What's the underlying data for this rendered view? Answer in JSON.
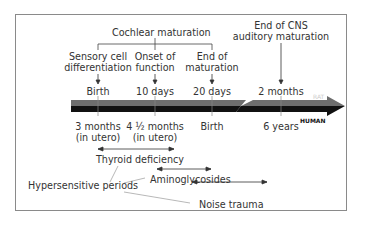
{
  "diagram": {
    "cochlear_header": "Cochlear maturation",
    "milestones": [
      {
        "label_line1": "Sensory cell",
        "label_line2": "differentiation",
        "rat": "Birth",
        "human_line1": "3 months",
        "human_line2": "(in utero)"
      },
      {
        "label_line1": "Onset of",
        "label_line2": "function",
        "rat": "10 days",
        "human_line1": "4 ½ months",
        "human_line2": "(in utero)"
      },
      {
        "label_line1": "End of",
        "label_line2": "maturation",
        "rat": "20 days",
        "human_line1": "Birth",
        "human_line2": ""
      },
      {
        "label_line1": "End of CNS",
        "label_line2": "auditory maturation",
        "rat": "2 months",
        "human_line1": "6 years",
        "human_line2": ""
      }
    ],
    "species": {
      "rat": "RAT",
      "human": "HUMAN"
    },
    "hypersensitive_label": "Hypersensitive periods",
    "periods": [
      {
        "label": "Thyroid deficiency"
      },
      {
        "label": "Aminoglycosides"
      },
      {
        "label": "Noise trauma"
      }
    ],
    "colors": {
      "rat_bar": "#6e6e6e",
      "human_bar": "#111111",
      "border": "#8a8a8a",
      "text": "#333333"
    }
  }
}
